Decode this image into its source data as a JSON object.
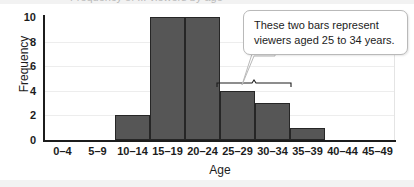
{
  "title_sliver": "Frequency of ... viewers by age",
  "chart_data": {
    "type": "bar",
    "title": "",
    "xlabel": "Age",
    "ylabel": "Frequency",
    "categories": [
      "0–4",
      "5–9",
      "10–14",
      "15–19",
      "20–24",
      "25–29",
      "30–34",
      "35–39",
      "40–44",
      "45–49"
    ],
    "values": [
      0,
      0,
      2,
      10,
      10,
      4,
      3,
      1,
      0,
      0
    ],
    "ylim": [
      0,
      10
    ],
    "yticks": [
      "0",
      "2",
      "4",
      "6",
      "8",
      "10"
    ],
    "ytick_values": [
      0,
      2,
      4,
      6,
      8,
      10
    ],
    "grid": true,
    "legend": "none",
    "bar_color": "#565656",
    "bar_edge_color": "#262626",
    "grid_color": "#ededed",
    "axis_color": "#1c1c1c"
  },
  "annotation": {
    "callout_text": "These two bars represent viewers aged 25 to 34 years.",
    "brace_covers": [
      "25–29",
      "30–34"
    ]
  }
}
